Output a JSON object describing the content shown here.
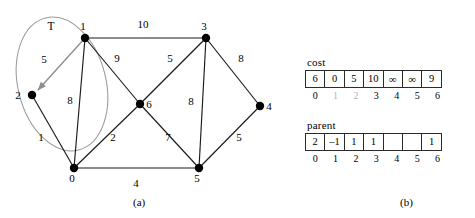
{
  "figure": {
    "panel_a": {
      "caption": "(a)",
      "set_label": "T",
      "nodes": [
        {
          "id": "0",
          "label": "0",
          "x": 74,
          "y": 168,
          "label_dx": -2,
          "label_dy": 14
        },
        {
          "id": "1",
          "label": "1",
          "x": 85,
          "y": 38,
          "label_dx": -2,
          "label_dy": -8
        },
        {
          "id": "2",
          "label": "2",
          "x": 32,
          "y": 95,
          "label_dx": -14,
          "label_dy": 4
        },
        {
          "id": "3",
          "label": "3",
          "x": 206,
          "y": 38,
          "label_dx": -2,
          "label_dy": -8
        },
        {
          "id": "4",
          "label": "4",
          "x": 260,
          "y": 106,
          "label_dx": 8,
          "label_dy": 4
        },
        {
          "id": "5",
          "label": "5",
          "x": 199,
          "y": 168,
          "label_dx": -2,
          "label_dy": 14
        },
        {
          "id": "6",
          "label": "6",
          "x": 140,
          "y": 104,
          "label_dx": 8,
          "label_dy": 4
        }
      ],
      "edges": [
        {
          "from": "1",
          "to": "3",
          "weight": "10",
          "lx": 143,
          "ly": 28,
          "tree": false
        },
        {
          "from": "1",
          "to": "6",
          "weight": "9",
          "lx": 117,
          "ly": 62,
          "tree": false
        },
        {
          "from": "1",
          "to": "0",
          "weight": "8",
          "lx": 70,
          "ly": 104,
          "tree": false
        },
        {
          "from": "1",
          "to": "2",
          "weight": "5",
          "lx": 44,
          "ly": 63,
          "tree": true
        },
        {
          "from": "2",
          "to": "0",
          "weight": "1",
          "lx": 41,
          "ly": 141,
          "tree": false
        },
        {
          "from": "3",
          "to": "6",
          "weight": "5",
          "lx": 170,
          "ly": 62,
          "tree": false
        },
        {
          "from": "3",
          "to": "4",
          "weight": "8",
          "lx": 241,
          "ly": 62,
          "tree": false
        },
        {
          "from": "3",
          "to": "5",
          "weight": "8",
          "lx": 191,
          "ly": 105,
          "tree": false
        },
        {
          "from": "6",
          "to": "0",
          "weight": "2",
          "lx": 113,
          "ly": 141,
          "tree": false
        },
        {
          "from": "6",
          "to": "5",
          "weight": "7",
          "lx": 168,
          "ly": 141,
          "tree": false
        },
        {
          "from": "4",
          "to": "5",
          "weight": "5",
          "lx": 239,
          "ly": 141,
          "tree": false
        },
        {
          "from": "0",
          "to": "5",
          "weight": "4",
          "lx": 136,
          "ly": 187,
          "tree": false
        }
      ]
    },
    "panel_b": {
      "caption": "(b)",
      "arrays": [
        {
          "name": "cost",
          "title": "cost",
          "values": [
            "6",
            "0",
            "5",
            "10",
            "∞",
            "∞",
            "9"
          ],
          "indices": [
            "0",
            "1",
            "2",
            "3",
            "4",
            "5",
            "6"
          ],
          "dim_indices": [
            "1",
            "2"
          ]
        },
        {
          "name": "parent",
          "title": "parent",
          "values": [
            "2",
            "–1",
            "1",
            "1",
            "",
            "",
            "1"
          ],
          "indices": [
            "0",
            "1",
            "2",
            "3",
            "4",
            "5",
            "6"
          ],
          "dim_indices": []
        }
      ]
    }
  },
  "colors": {
    "edge": "#1a1a1a",
    "tree_edge": "#8d8d8d",
    "ellipse": "#9a9a9a",
    "dim_index": "#b3b3b3"
  }
}
